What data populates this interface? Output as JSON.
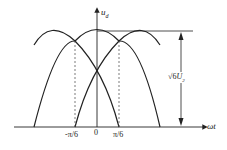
{
  "diagram": {
    "y_axis_label": "u",
    "y_axis_sub": "d",
    "x_axis_label": "ωt",
    "ticks": [
      "-π/6",
      "0",
      "π/6"
    ],
    "amplitude_label": "√6",
    "amplitude_var": "U",
    "amplitude_sub": "2",
    "line_color": "#222222"
  }
}
